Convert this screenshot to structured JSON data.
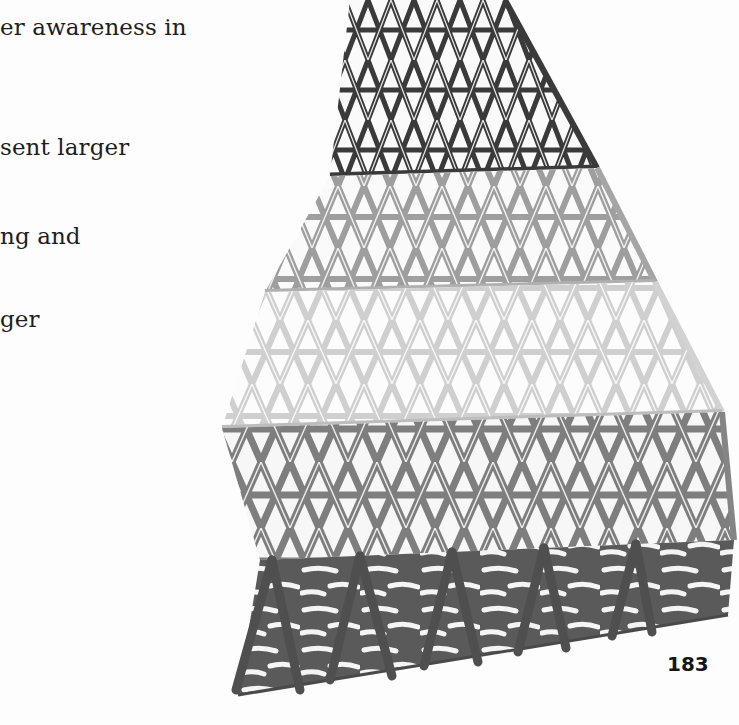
{
  "page": {
    "text_fragments": [
      {
        "text": "er awareness in",
        "top": 14
      },
      {
        "text": "sent larger",
        "top": 134
      },
      {
        "text": "ng and",
        "top": 223
      },
      {
        "text": "ger",
        "top": 306
      }
    ],
    "page_number": "183"
  },
  "figure": {
    "bands": [
      {
        "name": "apex-band",
        "shade": "#4a4a4a"
      },
      {
        "name": "upper-band",
        "shade": "#a9a9a9"
      },
      {
        "name": "middle-band",
        "shade": "#d8d8d8"
      },
      {
        "name": "lower-band",
        "shade": "#8d8d8d"
      },
      {
        "name": "base-band",
        "shade": "#5a5a5a"
      }
    ]
  }
}
